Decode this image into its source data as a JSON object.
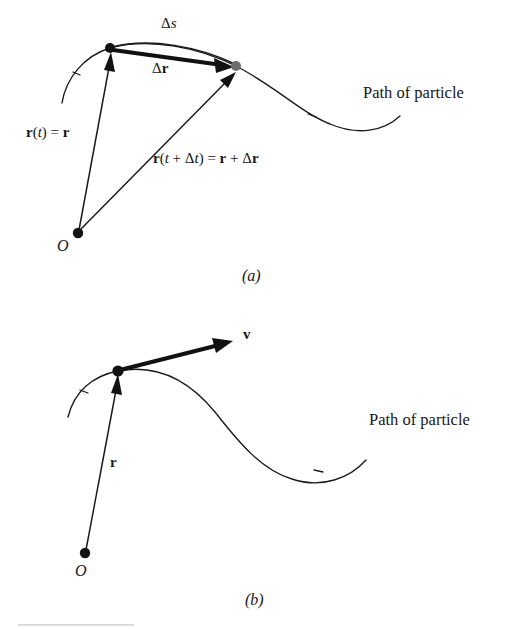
{
  "figure": {
    "type": "physics-vector-diagram",
    "background_color": "#ffffff",
    "ink_color": "#1b1b1b",
    "secondary_point_color": "#6e6e6e",
    "panels": [
      {
        "id": "a",
        "caption": "(a)",
        "caption_text_plain": "(a)",
        "description": "Position vectors at time t and t + Δt to two points on a curved particle path, with displacement Δr and arc length Δs",
        "labels": {
          "arc_length": "Δs",
          "arc_length_parts": {
            "delta": "Δ",
            "symbol": "s"
          },
          "displacement": "Δr",
          "displacement_parts": {
            "delta": "Δ",
            "symbol": "r"
          },
          "position_first": "r(t) = r",
          "position_first_parts": {
            "r1": "r",
            "open": "(",
            "t": "t",
            "close": ")",
            "eq": " = ",
            "r2": "r"
          },
          "position_second": "r(t + Δt) = r + Δr",
          "position_second_parts": {
            "r1": "r",
            "open": "(",
            "t": "t",
            "plus": " + ",
            "delta1": "Δ",
            "t2": "t",
            "close": ")",
            "eq": " = ",
            "r2": "r",
            "plus2": " + ",
            "delta2": "Δ",
            "r3": "r"
          },
          "path": "Path of particle",
          "origin": "O"
        },
        "points": {
          "origin": {
            "x": 78,
            "y": 233,
            "color": "#121212"
          },
          "particle_t": {
            "x": 110,
            "y": 48,
            "color": "#121212"
          },
          "particle_t_plus_dt": {
            "x": 236,
            "y": 66,
            "color": "#6e6e6e"
          }
        }
      },
      {
        "id": "b",
        "caption": "(b)",
        "caption_text_plain": "(b)",
        "description": "Position vector r to a point on the particle path with the instantaneous velocity vector v tangent to the path",
        "labels": {
          "velocity": "v",
          "position": "r",
          "path": "Path of particle",
          "origin": "O"
        },
        "points": {
          "origin": {
            "x": 85,
            "y": 553,
            "color": "#121212"
          },
          "particle": {
            "x": 118,
            "y": 371,
            "color": "#121212"
          },
          "velocity_tip": {
            "x": 232,
            "y": 341
          }
        }
      }
    ]
  }
}
